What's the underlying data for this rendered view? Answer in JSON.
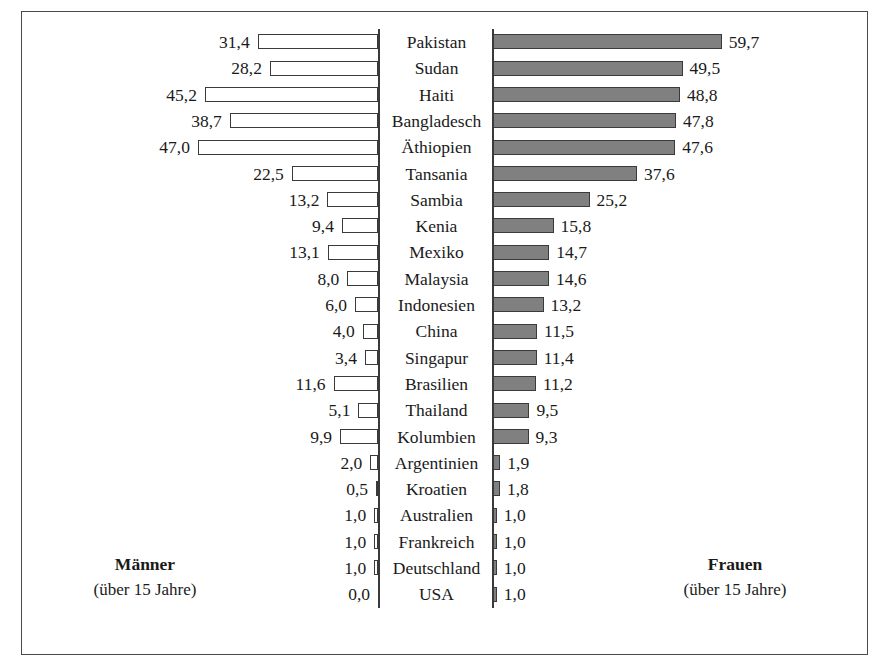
{
  "legend": {
    "men": {
      "title": "Männer",
      "subtitle": "(über 15 Jahre)"
    },
    "women": {
      "title": "Frauen",
      "subtitle": "(über 15 Jahre)"
    }
  },
  "colors": {
    "men_bar_fill": "#ffffff",
    "women_bar_fill": "#808080",
    "bar_outline": "#3a3a3a",
    "frame": "#4a4a4a",
    "text": "#1a1a1a"
  },
  "chart_data": {
    "type": "bar",
    "title": "",
    "subtitle": "",
    "xlabel": "",
    "ylabel": "",
    "orientation": "horizontal",
    "layout": "diverging-butterfly",
    "grid": false,
    "legend_position": "bottom",
    "axis_note": "Two mirrored value axes; left series grows leftward, right series grows rightward",
    "xlim": [
      0,
      59.7
    ],
    "categories": [
      "Pakistan",
      "Sudan",
      "Haiti",
      "Bangladesch",
      "Äthiopien",
      "Tansania",
      "Sambia",
      "Kenia",
      "Mexiko",
      "Malaysia",
      "Indonesien",
      "China",
      "Singapur",
      "Brasilien",
      "Thailand",
      "Kolumbien",
      "Argentinien",
      "Kroatien",
      "Australien",
      "Frankreich",
      "Deutschland",
      "USA"
    ],
    "series": [
      {
        "name": "Männer (über 15 Jahre)",
        "side": "left",
        "fill": "#ffffff",
        "values": [
          31.4,
          28.2,
          45.2,
          38.7,
          47.0,
          22.5,
          13.2,
          9.4,
          13.1,
          8.0,
          6.0,
          4.0,
          3.4,
          11.6,
          5.1,
          9.9,
          2.0,
          0.5,
          1.0,
          1.0,
          1.0,
          0.0
        ],
        "labels": [
          "31,4",
          "28,2",
          "45,2",
          "38,7",
          "47,0",
          "22,5",
          "13,2",
          "9,4",
          "13,1",
          "8,0",
          "6,0",
          "4,0",
          "3,4",
          "11,6",
          "5,1",
          "9,9",
          "2,0",
          "0,5",
          "1,0",
          "1,0",
          "1,0",
          "0,0"
        ]
      },
      {
        "name": "Frauen (über 15 Jahre)",
        "side": "right",
        "fill": "#808080",
        "values": [
          59.7,
          49.5,
          48.8,
          47.8,
          47.6,
          37.6,
          25.2,
          15.8,
          14.7,
          14.6,
          13.2,
          11.5,
          11.4,
          11.2,
          9.5,
          9.3,
          1.9,
          1.8,
          1.0,
          1.0,
          1.0,
          1.0
        ],
        "labels": [
          "59,7",
          "49,5",
          "48,8",
          "47,8",
          "47,6",
          "37,6",
          "25,2",
          "15,8",
          "14,7",
          "14,6",
          "13,2",
          "11,5",
          "11,4",
          "11,2",
          "9,5",
          "9,3",
          "1,9",
          "1,8",
          "1,0",
          "1,0",
          "1,0",
          "1,0"
        ]
      }
    ]
  }
}
